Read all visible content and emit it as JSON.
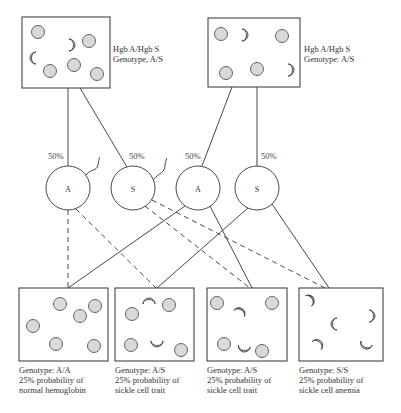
{
  "diagram": {
    "type": "sickle-cell inheritance punnett diagram",
    "parents": [
      {
        "id": "parent-1",
        "line1": "Hgb A/Hgb S",
        "line2": "Genotype, A/S"
      },
      {
        "id": "parent-2",
        "line1": "Hgb A/Hgb S",
        "line2": "Genotype: A/S"
      }
    ],
    "gametes": [
      {
        "allele": "A",
        "percent": "50%"
      },
      {
        "allele": "S",
        "percent": "50%"
      },
      {
        "allele": "A",
        "percent": "50%"
      },
      {
        "allele": "S",
        "percent": "50%"
      }
    ],
    "offspring": [
      {
        "genotype": "Genotype: A/A",
        "prob": "25% probability of",
        "outcome": "normal hemoglobin"
      },
      {
        "genotype": "Genotype: A/S",
        "prob": "25% probability of",
        "outcome": "sickle cell trait"
      },
      {
        "genotype": "Genotype: A/S",
        "prob": "25% probability of",
        "outcome": "sickle cell trait"
      },
      {
        "genotype": "Genotype: S/S",
        "prob": "25% probability of",
        "outcome": "sickle cell anemia"
      }
    ],
    "colors": {
      "line": "#333333",
      "cell_fill": "#d9d9d9",
      "cell_stroke": "#555555"
    }
  }
}
